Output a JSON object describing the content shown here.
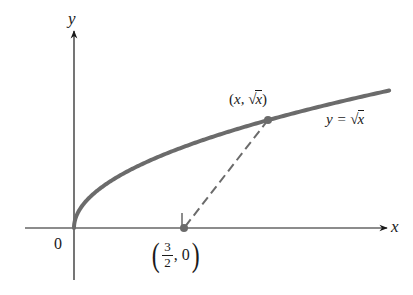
{
  "diagram": {
    "type": "function-graph",
    "axes": {
      "x_label": "x",
      "y_label": "y",
      "origin_label": "0"
    },
    "curve": {
      "equation_lhs": "y =",
      "equation_rad": "√",
      "equation_var": "x",
      "color": "#6b6b6b"
    },
    "points": {
      "on_curve": {
        "open": "(",
        "x": "x,",
        "rad": "√",
        "var": "x",
        "close": ")"
      },
      "on_axis": {
        "open": "(",
        "numerator": "3",
        "denominator": "2",
        "rest": ", 0",
        "close": ")"
      }
    },
    "segment": {
      "style": "dashed",
      "from": "(x, √x)",
      "to": "(3/2, 0)"
    },
    "colors": {
      "axis": "#1a1a1a",
      "curve": "#6b6b6b",
      "point": "#6b6b6b",
      "dashed": "#6b6b6b"
    }
  }
}
